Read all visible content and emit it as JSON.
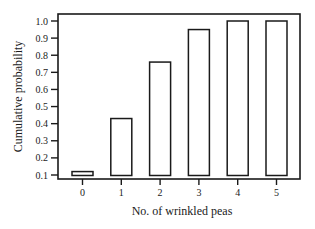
{
  "chart_data": {
    "type": "bar",
    "title": "",
    "xlabel": "No. of wrinkled peas",
    "ylabel": "Cumulative probability",
    "categories": [
      "0",
      "1",
      "2",
      "3",
      "4",
      "5"
    ],
    "values": [
      0.12,
      0.43,
      0.76,
      0.95,
      1.0,
      1.0
    ],
    "ylim": [
      0.1,
      1.0
    ],
    "yticks": [
      "0.1",
      "0.2",
      "0.3",
      "0.4",
      "0.5",
      "0.6",
      "0.7",
      "0.8",
      "0.9",
      "1.0"
    ],
    "grid": false,
    "legend": null,
    "bar_style": "outlined, white fill"
  },
  "colors": {
    "stroke": "#1a1a1a",
    "fill": "#ffffff"
  }
}
